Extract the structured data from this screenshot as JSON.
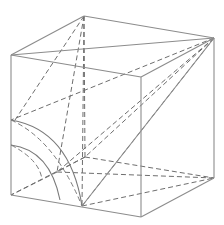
{
  "diagram": {
    "type": "cube-geometry",
    "colors": {
      "stroke": "#8c8c8c",
      "dash": "#6e6e6e",
      "background": "#ffffff"
    },
    "vertices": {
      "A_top_back_left": [
        84,
        16
      ],
      "B_top_back_right": [
        214,
        38
      ],
      "C_top_front_left": [
        11,
        55
      ],
      "D_top_front_right": [
        141,
        77
      ],
      "E_bottom_front_left": [
        11,
        195
      ],
      "F_bottom_front_right": [
        141,
        217
      ],
      "G_bottom_back_right": [
        214,
        178
      ],
      "H_bottom_back_left": [
        85,
        157
      ],
      "P_interior": [
        57,
        172
      ],
      "M_left_edge": [
        11,
        120
      ],
      "N_bottom_edge": [
        82,
        206
      ]
    },
    "visible_edges": [
      [
        "A_top_back_left",
        "B_top_back_right"
      ],
      [
        "A_top_back_left",
        "C_top_front_left"
      ],
      [
        "C_top_front_left",
        "D_top_front_right"
      ],
      [
        "D_top_front_right",
        "B_top_back_right"
      ],
      [
        "C_top_front_left",
        "E_bottom_front_left"
      ],
      [
        "D_top_front_right",
        "F_bottom_front_right"
      ],
      [
        "B_top_back_right",
        "G_bottom_back_right"
      ],
      [
        "E_bottom_front_left",
        "F_bottom_front_right"
      ],
      [
        "F_bottom_front_right",
        "G_bottom_back_right"
      ],
      [
        "C_top_front_left",
        "B_top_back_right"
      ],
      [
        "B_top_back_right",
        "F_bottom_front_right"
      ]
    ],
    "hidden_edges": [
      [
        "A_top_back_left",
        "H_bottom_back_left"
      ],
      [
        "H_bottom_back_left",
        "E_bottom_front_left"
      ],
      [
        "H_bottom_back_left",
        "G_bottom_back_right"
      ]
    ],
    "dashed_segments": [
      [
        "A_top_back_left",
        "P_interior"
      ],
      [
        "A_top_back_left",
        "N_bottom_edge"
      ],
      [
        "B_top_back_right",
        "P_interior"
      ],
      [
        "B_top_back_right",
        "H_bottom_back_left"
      ],
      [
        "B_top_back_right",
        "M_left_edge"
      ],
      [
        "B_top_back_right",
        "N_bottom_edge"
      ],
      [
        "P_interior",
        "G_bottom_back_right"
      ],
      [
        "N_bottom_edge",
        "G_bottom_back_right"
      ]
    ]
  }
}
